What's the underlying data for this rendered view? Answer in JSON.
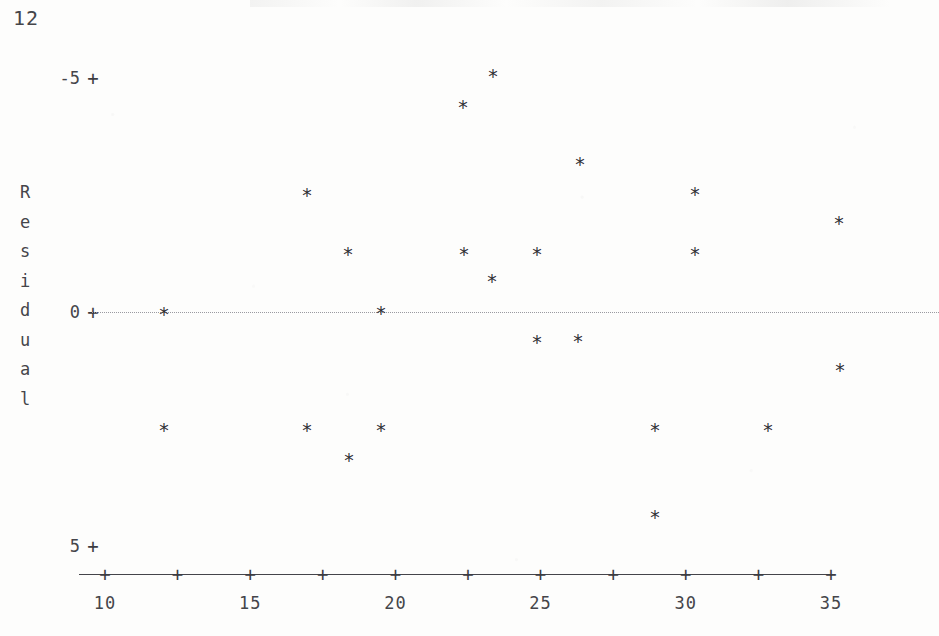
{
  "page_number": "12",
  "chart_data": {
    "type": "scatter",
    "title": "",
    "xlabel": "",
    "ylabel": "Residual",
    "ylabel_letters": [
      "R",
      "e",
      "s",
      "i",
      "d",
      "u",
      "a",
      "l"
    ],
    "marker": "*",
    "grid": false,
    "legend": null,
    "zero_reference_line": {
      "value": 0,
      "style": "dotted",
      "color": "#9a9aa0"
    },
    "axis_style": "character-plot",
    "xlim": [
      9.2,
      35.8
    ],
    "ylim": [
      -5.6,
      5.9
    ],
    "yticks": [
      5,
      0,
      -5
    ],
    "ytick_labels": [
      "5",
      "0",
      "-5"
    ],
    "xticks": [
      10,
      12.5,
      15,
      17.5,
      20,
      22.5,
      25,
      27.5,
      30,
      32.5,
      35
    ],
    "xtick_labels": [
      "10",
      "",
      "15",
      "",
      "20",
      "",
      "25",
      "",
      "30",
      "",
      "35"
    ],
    "x": [
      11.9,
      11.9,
      16.7,
      17.9,
      18.2,
      19.2,
      19.2,
      22.2,
      22.4,
      23.2,
      23.3,
      24.8,
      24.8,
      25.9,
      26.0,
      28.7,
      28.7,
      30.2,
      30.3,
      32.7,
      34.9,
      35.0,
      16.5,
      18.0
    ],
    "y": [
      0.0,
      -2.05,
      2.4,
      1.5,
      -2.6,
      0.0,
      -2.05,
      4.4,
      1.5,
      5.05,
      0.9,
      1.5,
      -0.65,
      3.15,
      -0.7,
      -2.05,
      -4.35,
      2.4,
      1.5,
      -2.05,
      2.15,
      -1.3,
      2.4,
      -2.05
    ],
    "points": [
      {
        "x": 11.9,
        "y": 0.0,
        "px": 164,
        "py": 312
      },
      {
        "x": 11.9,
        "y": -2.05,
        "px": 164,
        "py": 428
      },
      {
        "x": 16.7,
        "y": 2.4,
        "px": 307,
        "py": 193
      },
      {
        "x": 16.6,
        "y": -2.05,
        "px": 307,
        "py": 428
      },
      {
        "x": 17.9,
        "y": 1.5,
        "px": 348,
        "py": 252
      },
      {
        "x": 18.2,
        "y": -2.6,
        "px": 349,
        "py": 458
      },
      {
        "x": 19.2,
        "y": 0.0,
        "px": 381,
        "py": 311
      },
      {
        "x": 19.2,
        "y": -2.05,
        "px": 381,
        "py": 428
      },
      {
        "x": 22.2,
        "y": 4.4,
        "px": 463,
        "py": 105
      },
      {
        "x": 22.4,
        "y": 1.5,
        "px": 464,
        "py": 252
      },
      {
        "x": 23.2,
        "y": 5.05,
        "px": 493,
        "py": 74
      },
      {
        "x": 23.3,
        "y": 0.9,
        "px": 492,
        "py": 279
      },
      {
        "x": 24.8,
        "y": 1.5,
        "px": 537,
        "py": 252
      },
      {
        "x": 24.8,
        "y": -0.65,
        "px": 537,
        "py": 340
      },
      {
        "x": 25.9,
        "y": 3.15,
        "px": 580,
        "py": 162
      },
      {
        "x": 26.0,
        "y": -0.7,
        "px": 578,
        "py": 339
      },
      {
        "x": 28.7,
        "y": -2.05,
        "px": 655,
        "py": 428
      },
      {
        "x": 28.7,
        "y": -4.35,
        "px": 655,
        "py": 515
      },
      {
        "x": 30.2,
        "y": 2.4,
        "px": 695,
        "py": 192
      },
      {
        "x": 30.3,
        "y": 1.5,
        "px": 695,
        "py": 252
      },
      {
        "x": 32.7,
        "y": -2.05,
        "px": 768,
        "py": 428
      },
      {
        "x": 34.9,
        "y": 2.15,
        "px": 839,
        "py": 221
      },
      {
        "x": 35.0,
        "y": -1.3,
        "px": 840,
        "py": 368
      }
    ]
  },
  "axes_pixel_mapping": {
    "x_pixels": [
      105,
      175,
      258,
      328,
      399,
      470,
      540,
      692,
      831
    ],
    "x_values": [
      10,
      12.5,
      15,
      17.5,
      20,
      22.5,
      25,
      30,
      35
    ],
    "y_pixels": [
      78,
      312,
      546
    ],
    "y_values": [
      5,
      0,
      -5
    ]
  }
}
